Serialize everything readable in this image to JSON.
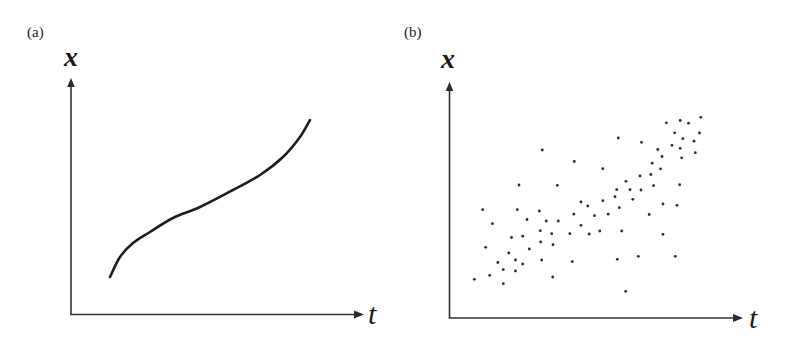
{
  "figure": {
    "panels": [
      {
        "label": "(a)",
        "y_axis_label": "x",
        "x_axis_label": "t",
        "description": "smooth continuous increasing curve"
      },
      {
        "label": "(b)",
        "y_axis_label": "x",
        "x_axis_label": "t",
        "description": "scattered discrete points with increasing trend"
      }
    ]
  },
  "chart_data": [
    {
      "type": "line",
      "title": "(a)",
      "xlabel": "t",
      "ylabel": "x",
      "grid": false,
      "ticks": "none",
      "note": "Coordinates in pixel space of panel (a): origin at (71,314); y grows upward",
      "x": [
        39,
        49,
        62,
        79,
        102,
        129,
        162,
        189,
        212,
        229,
        239
      ],
      "values": [
        37,
        57,
        71,
        82,
        96,
        107,
        124,
        139,
        157,
        177,
        194
      ],
      "stroke_color": "#1e1e1e"
    },
    {
      "type": "scatter",
      "title": "(b)",
      "xlabel": "t",
      "ylabel": "x",
      "grid": false,
      "ticks": "none",
      "note": "Screen pixel coordinates of each dot",
      "points": [
        [
          474.3,
          279.3
        ],
        [
          482.7,
          209.7
        ],
        [
          485.7,
          247.3
        ],
        [
          489.7,
          275.3
        ],
        [
          492.5,
          223.7
        ],
        [
          497.8,
          262.5
        ],
        [
          503.3,
          269.7
        ],
        [
          503.3,
          283.7
        ],
        [
          508.8,
          253.0
        ],
        [
          511.5,
          237.5
        ],
        [
          515.5,
          260.0
        ],
        [
          515.5,
          271.0
        ],
        [
          517.3,
          209.7
        ],
        [
          519.0,
          185.0
        ],
        [
          522.7,
          236.2
        ],
        [
          522.7,
          264.0
        ],
        [
          527.0,
          219.5
        ],
        [
          529.3,
          249.0
        ],
        [
          539.3,
          211.0
        ],
        [
          540.3,
          230.7
        ],
        [
          540.7,
          242.0
        ],
        [
          541.7,
          260.0
        ],
        [
          542.3,
          150.0
        ],
        [
          546.3,
          221.0
        ],
        [
          551.7,
          233.7
        ],
        [
          552.7,
          277.0
        ],
        [
          553.0,
          244.7
        ],
        [
          557.3,
          185.3
        ],
        [
          558.3,
          221.0
        ],
        [
          569.8,
          233.7
        ],
        [
          572.3,
          261.7
        ],
        [
          573.8,
          214.2
        ],
        [
          574.3,
          161.5
        ],
        [
          581.0,
          202.0
        ],
        [
          581.0,
          225.3
        ],
        [
          587.7,
          206.0
        ],
        [
          589.2,
          234.0
        ],
        [
          594.5,
          215.7
        ],
        [
          599.8,
          231.0
        ],
        [
          602.7,
          168.7
        ],
        [
          602.8,
          200.7
        ],
        [
          608.2,
          214.2
        ],
        [
          615.0,
          196.7
        ],
        [
          616.7,
          189.7
        ],
        [
          617.3,
          259.3
        ],
        [
          618.3,
          138.0
        ],
        [
          619.3,
          207.7
        ],
        [
          621.7,
          231.0
        ],
        [
          625.7,
          291.3
        ],
        [
          626.0,
          181.3
        ],
        [
          630.0,
          189.7
        ],
        [
          632.8,
          199.3
        ],
        [
          638.3,
          256.3
        ],
        [
          640.0,
          176.0
        ],
        [
          641.0,
          190.0
        ],
        [
          641.5,
          142.3
        ],
        [
          649.2,
          214.5
        ],
        [
          650.8,
          174.5
        ],
        [
          652.2,
          163.2
        ],
        [
          653.5,
          185.7
        ],
        [
          657.8,
          149.5
        ],
        [
          660.5,
          168.8
        ],
        [
          662.0,
          156.5
        ],
        [
          663.0,
          204.0
        ],
        [
          663.0,
          234.3
        ],
        [
          666.3,
          122.8
        ],
        [
          672.0,
          145.3
        ],
        [
          674.7,
          132.8
        ],
        [
          675.3,
          256.3
        ],
        [
          677.0,
          205.3
        ],
        [
          679.7,
          184.7
        ],
        [
          680.2,
          120.5
        ],
        [
          680.2,
          148.3
        ],
        [
          681.7,
          157.8
        ],
        [
          682.8,
          138.7
        ],
        [
          688.5,
          123.2
        ],
        [
          694.0,
          141.2
        ],
        [
          695.3,
          152.7
        ],
        [
          699.5,
          133.0
        ],
        [
          700.8,
          117.3
        ]
      ],
      "point_color": "#2b2b2b",
      "point_radius": 1.4
    }
  ]
}
